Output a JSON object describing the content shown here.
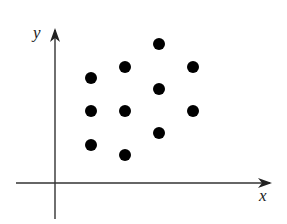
{
  "figure": {
    "axes": {
      "x_label": "x",
      "y_label": "y",
      "origin_px": [
        55,
        183
      ],
      "line_color": "#333333"
    },
    "points_px": [
      {
        "cx": 91,
        "cy": 78
      },
      {
        "cx": 91,
        "cy": 111
      },
      {
        "cx": 91,
        "cy": 145
      },
      {
        "cx": 125,
        "cy": 67
      },
      {
        "cx": 125,
        "cy": 111
      },
      {
        "cx": 125,
        "cy": 155
      },
      {
        "cx": 159,
        "cy": 44
      },
      {
        "cx": 159,
        "cy": 89
      },
      {
        "cx": 159,
        "cy": 133
      },
      {
        "cx": 193,
        "cy": 67
      },
      {
        "cx": 193,
        "cy": 111
      }
    ],
    "point_color": "#000000",
    "point_radius": 6
  },
  "chart_data": {
    "type": "scatter",
    "title": "",
    "xlabel": "x",
    "ylabel": "y",
    "grid": false,
    "legend": null,
    "ticks": "none",
    "units": "relative (pixels from origin, y up)",
    "x": [
      36,
      36,
      36,
      70,
      70,
      70,
      104,
      104,
      104,
      138,
      138
    ],
    "y": [
      105,
      72,
      38,
      116,
      72,
      28,
      139,
      94,
      50,
      116,
      72
    ],
    "xlim": [
      -39,
      215
    ],
    "ylim": [
      -35,
      147
    ]
  }
}
